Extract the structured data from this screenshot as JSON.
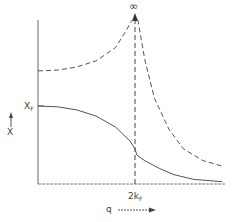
{
  "chart_data": {
    "type": "line",
    "title": "",
    "xlabel": "q",
    "ylabel": "χ",
    "x_tick_labels": [
      {
        "label": "2k",
        "subscript": "F",
        "x": 1.0
      }
    ],
    "y_tick_labels": [
      {
        "label": "χ",
        "subscript": "F",
        "y": 1.0
      }
    ],
    "annotations": [
      {
        "text": "∞",
        "at": "top of divergence at q = 2k_F"
      }
    ],
    "grid": false,
    "legend": null,
    "xlim": [
      0,
      1.9
    ],
    "ylim": [
      0,
      2.1
    ],
    "x_units": "q / 2k_F",
    "y_units": "χ / χ_F",
    "series": [
      {
        "name": "dashed curve (divergent at 2k_F)",
        "style": "dashed",
        "points": [
          [
            0.0,
            1.45
          ],
          [
            0.2,
            1.46
          ],
          [
            0.4,
            1.5
          ],
          [
            0.6,
            1.58
          ],
          [
            0.8,
            1.75
          ],
          [
            0.9,
            1.95
          ],
          [
            0.97,
            2.1
          ],
          [
            1.03,
            2.1
          ],
          [
            1.1,
            1.6
          ],
          [
            1.2,
            1.1
          ],
          [
            1.35,
            0.7
          ],
          [
            1.5,
            0.45
          ],
          [
            1.7,
            0.3
          ],
          [
            1.9,
            0.23
          ]
        ]
      },
      {
        "name": "solid curve (χ_F at q=0)",
        "style": "solid",
        "points": [
          [
            0.0,
            1.0
          ],
          [
            0.2,
            0.99
          ],
          [
            0.4,
            0.95
          ],
          [
            0.6,
            0.87
          ],
          [
            0.8,
            0.73
          ],
          [
            0.95,
            0.55
          ],
          [
            1.0,
            0.45
          ],
          [
            1.02,
            0.37
          ],
          [
            1.1,
            0.3
          ],
          [
            1.25,
            0.2
          ],
          [
            1.4,
            0.12
          ],
          [
            1.6,
            0.06
          ],
          [
            1.9,
            0.03
          ]
        ]
      }
    ],
    "vertical_markers": [
      {
        "x": 1.0,
        "style": "dashed",
        "label": "2k_F"
      }
    ]
  },
  "labels": {
    "y_axis_arrow": "↑",
    "y_axis_symbol": "X",
    "y_tick_main": "X",
    "y_tick_sub": "F",
    "x_tick_main": "2k",
    "x_tick_sub": "F",
    "x_axis_symbol": "q",
    "infinity": "∞"
  },
  "colors": {
    "line": "#444444",
    "axis": "#555555",
    "text": "#444444"
  }
}
